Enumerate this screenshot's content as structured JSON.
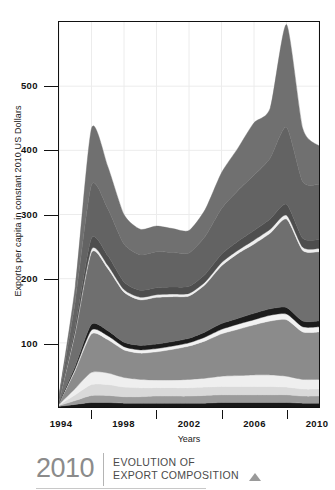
{
  "chart_data": {
    "type": "area",
    "stacked": true,
    "title": "EVOLUTION OF EXPORT COMPOSITION",
    "xlabel": "Years",
    "ylabel": "Exports per capita in constant 2010 US Dollars",
    "grid": true,
    "legend_position": "none",
    "xlim": [
      1994,
      2010
    ],
    "ylim": [
      0,
      600
    ],
    "x": [
      1994,
      1995,
      1996,
      1997,
      1998,
      1999,
      2000,
      2001,
      2002,
      2003,
      2004,
      2005,
      2006,
      2007,
      2008,
      2009,
      2010
    ],
    "xticks": [
      1994,
      1998,
      2002,
      2006,
      2010
    ],
    "xtick_labels": [
      "1994",
      "1998",
      "2002",
      "2006",
      "2010"
    ],
    "xminorticks": [
      1996,
      2000,
      2004,
      2008
    ],
    "yticks": [
      100,
      200,
      300,
      400,
      500
    ],
    "ytick_labels": [
      "100",
      "200",
      "300",
      "400",
      "500"
    ],
    "series": [
      {
        "name": "band-1",
        "color": "#171717",
        "values": [
          1,
          4,
          7,
          7,
          6,
          6,
          6,
          6,
          6,
          6,
          7,
          7,
          7,
          7,
          7,
          6,
          6
        ]
      },
      {
        "name": "band-2",
        "color": "#9b9b9b",
        "values": [
          1,
          6,
          11,
          11,
          10,
          10,
          11,
          11,
          11,
          12,
          12,
          12,
          12,
          12,
          12,
          11,
          11
        ]
      },
      {
        "name": "band-3",
        "color": "#d9d9d9",
        "values": [
          1,
          9,
          17,
          17,
          15,
          14,
          13,
          13,
          13,
          13,
          13,
          13,
          13,
          13,
          12,
          11,
          11
        ]
      },
      {
        "name": "band-4",
        "color": "#efefef",
        "values": [
          1,
          10,
          19,
          18,
          15,
          13,
          12,
          12,
          13,
          14,
          16,
          17,
          18,
          18,
          17,
          15,
          15
        ]
      },
      {
        "name": "band-5",
        "color": "#8b8b8b",
        "values": [
          2,
          28,
          60,
          52,
          43,
          41,
          44,
          48,
          52,
          58,
          66,
          72,
          78,
          84,
          88,
          74,
          74
        ]
      },
      {
        "name": "band-6",
        "color": "#f2f2f2",
        "values": [
          0,
          3,
          6,
          6,
          5,
          5,
          5,
          5,
          5,
          6,
          7,
          8,
          8,
          9,
          9,
          8,
          8
        ]
      },
      {
        "name": "band-7",
        "color": "#1c1c1c",
        "values": [
          1,
          4,
          9,
          8,
          7,
          7,
          7,
          7,
          7,
          8,
          9,
          9,
          10,
          10,
          10,
          9,
          9
        ]
      },
      {
        "name": "band-8",
        "color": "#6f6f6f",
        "values": [
          4,
          52,
          112,
          97,
          78,
          71,
          73,
          70,
          66,
          74,
          90,
          101,
          108,
          118,
          138,
          110,
          108
        ]
      },
      {
        "name": "band-9",
        "color": "#efefef",
        "values": [
          0,
          2,
          5,
          5,
          4,
          4,
          4,
          4,
          4,
          4,
          5,
          5,
          6,
          6,
          6,
          5,
          5
        ]
      },
      {
        "name": "band-10",
        "color": "#4e4e4e",
        "values": [
          1,
          8,
          17,
          15,
          12,
          11,
          11,
          11,
          11,
          12,
          13,
          14,
          15,
          16,
          17,
          14,
          14
        ]
      },
      {
        "name": "band-11",
        "color": "#636363",
        "values": [
          3,
          38,
          83,
          73,
          59,
          55,
          56,
          54,
          52,
          59,
          71,
          79,
          86,
          95,
          120,
          88,
          86
        ]
      },
      {
        "name": "band-12",
        "color": "#707070",
        "values": [
          2,
          24,
          88,
          66,
          46,
          40,
          40,
          37,
          35,
          42,
          56,
          66,
          82,
          78,
          160,
          83,
          60
        ]
      }
    ],
    "totals": [
      17,
      188,
      434,
      375,
      300,
      277,
      282,
      278,
      275,
      308,
      365,
      403,
      443,
      466,
      598,
      434,
      407
    ]
  },
  "footer": {
    "year": "2010",
    "line1": "EVOLUTION OF",
    "line2": "EXPORT COMPOSITION"
  }
}
